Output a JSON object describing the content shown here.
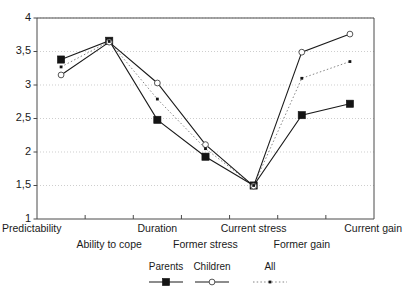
{
  "chart_data": {
    "type": "line",
    "title": "",
    "subtitle": "",
    "xlabel": "",
    "ylabel": "",
    "ylim": [
      1,
      4
    ],
    "ytick_labels": [
      "1",
      "1,5",
      "2",
      "2,5",
      "3",
      "3,5",
      "4"
    ],
    "ytick_values": [
      1,
      1.5,
      2,
      2.5,
      3,
      3.5,
      4
    ],
    "grid": true,
    "grid_orientation": "horizontal",
    "legend_position": "bottom",
    "decimal_separator": ",",
    "categories": [
      "Predictability",
      "Ability to cope",
      "Duration",
      "Former stress",
      "Current stress",
      "Former gain",
      "Current gain"
    ],
    "category_rows": [
      0,
      1,
      0,
      1,
      0,
      1,
      0
    ],
    "series": [
      {
        "name": "Parents",
        "marker": "filled-square",
        "line": "solid",
        "color": "#141414",
        "values": [
          3.38,
          3.66,
          2.48,
          1.93,
          1.5,
          2.55,
          2.72
        ]
      },
      {
        "name": "Children",
        "marker": "open-circle",
        "line": "solid",
        "color": "#555555",
        "values": [
          3.15,
          3.64,
          3.03,
          2.11,
          1.49,
          3.49,
          3.76
        ]
      },
      {
        "name": "All",
        "marker": "small-dot",
        "line": "dotted",
        "color": "#777777",
        "values": [
          3.27,
          3.65,
          2.79,
          2.05,
          1.5,
          3.1,
          3.35
        ]
      }
    ]
  },
  "legend": {
    "entries": [
      {
        "label": "Parents"
      },
      {
        "label": "Children"
      },
      {
        "label": "All"
      }
    ]
  }
}
